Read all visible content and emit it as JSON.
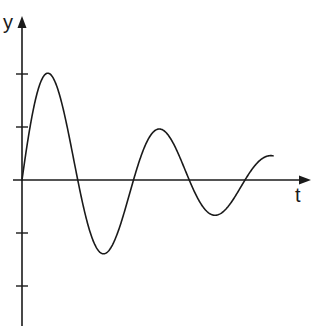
{
  "diagram": {
    "title": "",
    "type": "damped-oscillation",
    "colors": {
      "stroke": "#1a1a1a",
      "background": "#ffffff"
    },
    "axes": {
      "x_label": "t",
      "y_label": "y",
      "y_ticks": [
        2,
        1,
        -1,
        -2
      ],
      "origin_px": [
        22,
        180
      ],
      "y_unit_px": 53,
      "x_end_px": 311,
      "x_start_px": 13,
      "y_top_px": 16,
      "y_bottom_px": 326
    },
    "curve": {
      "equation": "y = A e^(-k t) sin(w t)",
      "zero_crossings_px": [
        22,
        78,
        133,
        189,
        245
      ],
      "extrema": [
        {
          "x_px": 50,
          "y": 2.0
        },
        {
          "x_px": 106,
          "y": -1.38
        },
        {
          "x_px": 161,
          "y": 0.98
        },
        {
          "x_px": 217,
          "y": -0.66
        }
      ],
      "end_px": [
        273,
        150
      ]
    }
  }
}
